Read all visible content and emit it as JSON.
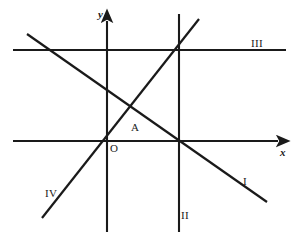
{
  "figure": {
    "type": "geometry-diagram",
    "background_color": "#ffffff",
    "stroke_color": "#1a1a1a",
    "width": 296,
    "height": 245
  },
  "axes": {
    "x_axis": {
      "label": "x",
      "label_position": {
        "x": 280,
        "y": 147
      },
      "from": {
        "x": 13,
        "y": 141
      },
      "to": {
        "x": 285,
        "y": 141
      },
      "arrow": "right"
    },
    "y_axis": {
      "label": "y",
      "label_position": {
        "x": 98,
        "y": 9
      },
      "from": {
        "x": 107,
        "y": 232
      },
      "to": {
        "x": 107,
        "y": 14
      },
      "arrow": "up"
    }
  },
  "lines": [
    {
      "label": "I",
      "kind": "descending-diagonal",
      "from": {
        "x": 27,
        "y": 34
      },
      "to": {
        "x": 267,
        "y": 202
      },
      "label_position": {
        "x": 243,
        "y": 176
      }
    },
    {
      "label": "II",
      "kind": "vertical",
      "from": {
        "x": 179,
        "y": 14
      },
      "to": {
        "x": 179,
        "y": 232
      },
      "label_position": {
        "x": 181,
        "y": 210
      }
    },
    {
      "label": "III",
      "kind": "horizontal",
      "from": {
        "x": 13,
        "y": 50
      },
      "to": {
        "x": 286,
        "y": 50
      },
      "label_position": {
        "x": 251,
        "y": 38
      }
    },
    {
      "label": "IV",
      "kind": "ascending-diagonal",
      "from": {
        "x": 42,
        "y": 218
      },
      "to": {
        "x": 199,
        "y": 19
      },
      "label_position": {
        "x": 45,
        "y": 188
      }
    }
  ],
  "points": [
    {
      "label": "O",
      "role": "origin",
      "at": {
        "x": 107,
        "y": 141
      },
      "label_position": {
        "x": 110,
        "y": 143
      }
    },
    {
      "label": "A",
      "role": "marked-point",
      "at": {
        "x": 135,
        "y": 128
      },
      "label_position": {
        "x": 131,
        "y": 122
      }
    }
  ],
  "intersections": [
    {
      "name": "lines-II-III-IV",
      "at": {
        "x": 179,
        "y": 50
      }
    },
    {
      "name": "lines-I-II-xaxis",
      "at": {
        "x": 179,
        "y": 141
      }
    },
    {
      "name": "origin-yaxis-xaxis-IV",
      "at": {
        "x": 107,
        "y": 141
      }
    },
    {
      "name": "lines-I-III",
      "at": {
        "x": 52,
        "y": 50
      }
    },
    {
      "name": "lines-I-IV",
      "at": {
        "x": 135,
        "y": 110
      }
    }
  ]
}
